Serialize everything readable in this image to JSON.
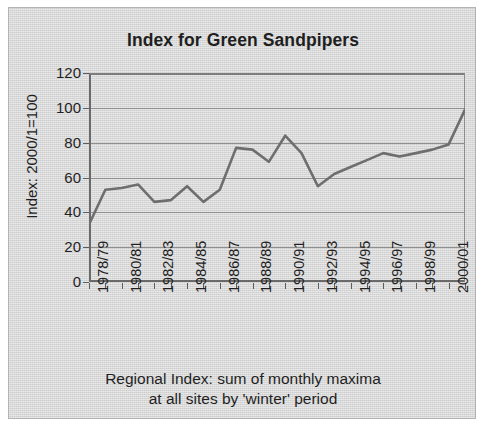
{
  "chart_data": {
    "type": "line",
    "title": "Index for Green Sandpipers",
    "ylabel": "Index: 2000/1=100",
    "xlabel_line1": "Regional Index: sum of monthly maxima",
    "xlabel_line2": "at all sites by 'winter' period",
    "ylim": [
      0,
      120
    ],
    "ytick_values": [
      120,
      100,
      80,
      60,
      40,
      20,
      0
    ],
    "ytick_labels": [
      "120",
      "100",
      "80",
      "60",
      "40",
      "20",
      "0"
    ],
    "grid": true,
    "grid_axis": "y",
    "legend": "none",
    "line_color": "#6e6e6e",
    "categories": [
      "1978/79",
      "1979/80",
      "1980/81",
      "1981/82",
      "1982/83",
      "1983/84",
      "1984/85",
      "1985/86",
      "1986/87",
      "1987/88",
      "1988/89",
      "1989/90",
      "1990/91",
      "1991/92",
      "1992/93",
      "1993/94",
      "1994/95",
      "1995/96",
      "1996/97",
      "1997/98",
      "1998/99",
      "1999/00",
      "2000/01",
      "2001/02"
    ],
    "xtick_labels": [
      "1978/79",
      "1980/81",
      "1982/83",
      "1984/85",
      "1986/87",
      "1988/89",
      "1990/91",
      "1992/93",
      "1994/95",
      "1996/97",
      "1998/99",
      "2000/01"
    ],
    "xtick_label_every": 2,
    "values": [
      33,
      53,
      54,
      56,
      46,
      47,
      55,
      46,
      53,
      77,
      76,
      69,
      84,
      74,
      55,
      62,
      66,
      70,
      74,
      72,
      74,
      76,
      79,
      99
    ]
  }
}
